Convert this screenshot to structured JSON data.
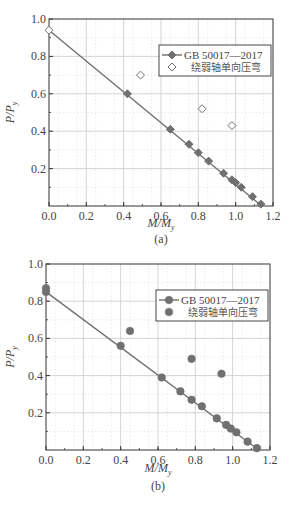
{
  "chart_data": [
    {
      "id": "a",
      "type": "scatter",
      "caption": "(a)",
      "xlabel": "M/My",
      "ylabel": "P/Py",
      "xlim": [
        0.0,
        1.2
      ],
      "ylim": [
        0.0,
        1.0
      ],
      "xticks": [
        "0.0",
        "0.2",
        "0.4",
        "0.6",
        "0.8",
        "1.0",
        "1.2"
      ],
      "yticks": [
        "0.2",
        "0.4",
        "0.6",
        "0.8",
        "1.0"
      ],
      "grid": true,
      "legend_position": "upper right",
      "series": [
        {
          "name": "GB 50017—2017",
          "style": "line-with-filled-diamond",
          "line": {
            "x": [
              0.0,
              1.14
            ],
            "y": [
              0.94,
              0.0
            ]
          },
          "points": [
            {
              "x": 0.42,
              "y": 0.6
            },
            {
              "x": 0.65,
              "y": 0.41
            },
            {
              "x": 0.75,
              "y": 0.33
            },
            {
              "x": 0.8,
              "y": 0.285
            },
            {
              "x": 0.855,
              "y": 0.24
            },
            {
              "x": 0.935,
              "y": 0.175
            },
            {
              "x": 0.98,
              "y": 0.14
            },
            {
              "x": 1.0,
              "y": 0.125
            },
            {
              "x": 1.03,
              "y": 0.1
            },
            {
              "x": 1.09,
              "y": 0.05
            },
            {
              "x": 1.135,
              "y": 0.01
            }
          ]
        },
        {
          "name": "绕弱轴单向压弯",
          "style": "open-diamond",
          "points": [
            {
              "x": 0.0,
              "y": 0.94
            },
            {
              "x": 0.49,
              "y": 0.7
            },
            {
              "x": 0.82,
              "y": 0.52
            },
            {
              "x": 0.98,
              "y": 0.43
            }
          ]
        }
      ]
    },
    {
      "id": "b",
      "type": "scatter",
      "caption": "(b)",
      "xlabel": "M/My",
      "ylabel": "P/Py",
      "xlim": [
        0.0,
        1.2
      ],
      "ylim": [
        0.0,
        1.0
      ],
      "xticks": [
        "0.0",
        "0.2",
        "0.4",
        "0.6",
        "0.8",
        "1.0",
        "1.2"
      ],
      "yticks": [
        "0.2",
        "0.4",
        "0.6",
        "0.8",
        "1.0"
      ],
      "grid": true,
      "legend_position": "upper right",
      "series": [
        {
          "name": "GB 50017—2017",
          "style": "line-with-filled-circle",
          "line": {
            "x": [
              0.0,
              1.14
            ],
            "y": [
              0.85,
              0.0
            ]
          },
          "points": [
            {
              "x": 0.0,
              "y": 0.85
            },
            {
              "x": 0.4,
              "y": 0.56
            },
            {
              "x": 0.62,
              "y": 0.39
            },
            {
              "x": 0.72,
              "y": 0.315
            },
            {
              "x": 0.78,
              "y": 0.27
            },
            {
              "x": 0.835,
              "y": 0.235
            },
            {
              "x": 0.915,
              "y": 0.17
            },
            {
              "x": 0.965,
              "y": 0.135
            },
            {
              "x": 0.99,
              "y": 0.115
            },
            {
              "x": 1.02,
              "y": 0.095
            },
            {
              "x": 1.08,
              "y": 0.045
            },
            {
              "x": 1.13,
              "y": 0.01
            }
          ]
        },
        {
          "name": "绕弱轴单向压弯",
          "style": "filled-circle",
          "points": [
            {
              "x": 0.0,
              "y": 0.87
            },
            {
              "x": 0.45,
              "y": 0.64
            },
            {
              "x": 0.78,
              "y": 0.49
            },
            {
              "x": 0.94,
              "y": 0.41
            }
          ]
        }
      ]
    }
  ],
  "labels": {
    "a": {
      "caption": "(a)",
      "x_axis_main": "M/M",
      "x_axis_sub": "y",
      "y_axis_main": "P/P",
      "y_axis_sub": "y",
      "legend_1": "GB 50017—2017",
      "legend_2": "绕弱轴单向压弯"
    },
    "b": {
      "caption": "(b)",
      "x_axis_main": "M/M",
      "x_axis_sub": "y",
      "y_axis_main": "P/P",
      "y_axis_sub": "y",
      "legend_1": "GB 50017—2017",
      "legend_2": "绕弱轴单向压弯"
    }
  },
  "colors": {
    "line": "#707070",
    "marker": "#707070",
    "grid_major": "#cfcfcf",
    "grid_minor": "#e4e4e4",
    "axis": "#333333"
  }
}
